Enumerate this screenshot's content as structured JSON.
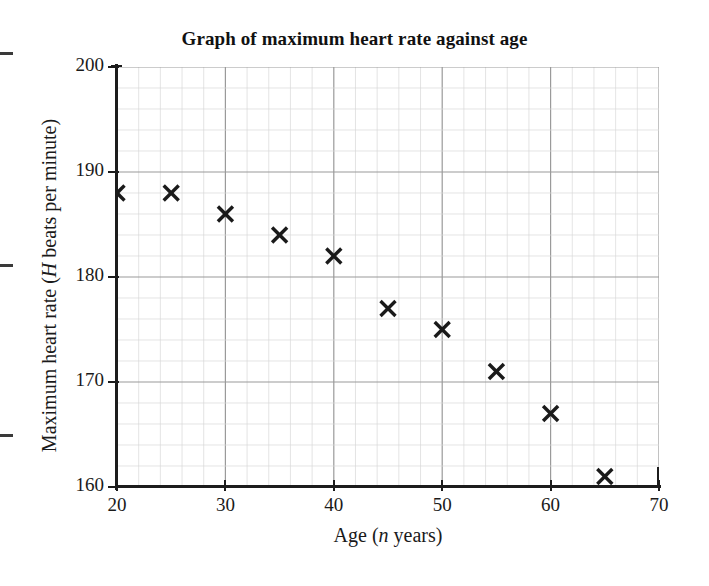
{
  "chart_data": {
    "type": "scatter",
    "title": "Graph of maximum heart rate against age",
    "xlabel": "Age (n years)",
    "xlabel_parts": {
      "before": "Age (",
      "italic": "n",
      "after": " years)"
    },
    "ylabel": "Maximum heart rate (H beats per minute)",
    "ylabel_parts": {
      "before": "Maximum heart rate (",
      "italic": "H",
      "after": " beats per minute)"
    },
    "xlim": [
      20,
      70
    ],
    "ylim": [
      160,
      200
    ],
    "x_major_ticks": [
      20,
      30,
      40,
      50,
      60,
      70
    ],
    "y_major_ticks": [
      160,
      170,
      180,
      190,
      200
    ],
    "x_minor_step": 2,
    "y_minor_step": 2,
    "grid": true,
    "legend": "none",
    "marker": "x-cross",
    "marker_color": "#1a1a1a",
    "x": [
      20,
      25,
      30,
      35,
      40,
      45,
      50,
      55,
      60,
      65
    ],
    "y": [
      188,
      188,
      186,
      184,
      182,
      177,
      175,
      171,
      167,
      161
    ],
    "points": [
      {
        "age": 20,
        "heart_rate": 188
      },
      {
        "age": 25,
        "heart_rate": 188
      },
      {
        "age": 30,
        "heart_rate": 186
      },
      {
        "age": 35,
        "heart_rate": 184
      },
      {
        "age": 40,
        "heart_rate": 182
      },
      {
        "age": 45,
        "heart_rate": 177
      },
      {
        "age": 50,
        "heart_rate": 175
      },
      {
        "age": 55,
        "heart_rate": 171
      },
      {
        "age": 60,
        "heart_rate": 167
      },
      {
        "age": 65,
        "heart_rate": 161
      }
    ]
  },
  "colors": {
    "background": "#ffffff",
    "axis": "#1c1c1c",
    "text": "#1a1a1a",
    "grid_major": "#9a9a9a",
    "grid_minor": "#d8d8d8",
    "marker": "#1a1a1a"
  },
  "edge_marks": [
    53,
    265,
    435
  ]
}
